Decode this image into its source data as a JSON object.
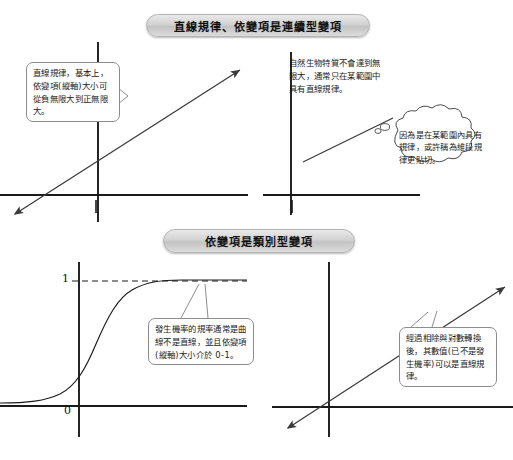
{
  "page": {
    "width": 513,
    "height": 460,
    "background": "#ffffff",
    "ink": "#1a1a1a"
  },
  "sections": [
    {
      "id": "continuous",
      "title": "直線規律、依變項是連續型變項"
    },
    {
      "id": "categorical",
      "title": "依變項是類別型變項"
    }
  ],
  "panels": {
    "top_left": {
      "name": "linear-full-range-plot",
      "axes": "cross",
      "line": "double-headed-straight-line",
      "callout": "直線規律，基本上，依變項(縱軸)大小可從負無限大到正無限大。"
    },
    "top_right": {
      "name": "linear-limited-range-plot",
      "axes": "L-shaped",
      "line": "short-straight-segment",
      "note": "自然生物特質不會達到無限大，通常只在某範圍中具有直線規律。",
      "cloud": "因為是在某範圍內具有規律，或許稱為維段規律更貼切。"
    },
    "bottom_left": {
      "name": "logistic-sigmoid-plot",
      "axes": "cross",
      "curve": "sigmoid",
      "y_top_label": "1",
      "origin_label": "0",
      "dashed_asymptote": true,
      "callout": "發生機率的規率通常是曲線不是直線，並且依變項(縱軸)大小介於 0-1。"
    },
    "bottom_right": {
      "name": "logit-transformed-linear-plot",
      "axes": "cross",
      "line": "double-headed-straight-line",
      "callout": "經過相除與對數轉換後，其數值(已不是發生機率)可以是直線規律。"
    }
  },
  "colors": {
    "pill_fill_light": "#e9e9e9",
    "pill_fill_dark": "#c3c3c3",
    "pill_border": "#b4b4b4",
    "axis": "#1a1a1a",
    "line": "#3a3a3a",
    "callout_border": "#8d8d8d"
  }
}
